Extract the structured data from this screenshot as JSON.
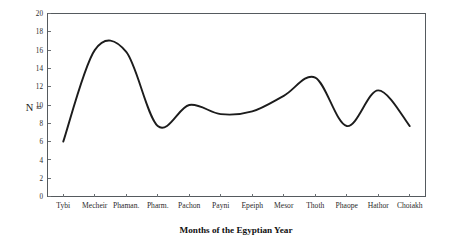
{
  "chart_data": {
    "type": "line",
    "title": "",
    "xlabel": "Months of the Egyptian Year",
    "ylabel": "N =",
    "categories": [
      "Tybi",
      "Mecheir",
      "Phaman.",
      "Pharm.",
      "Pachon",
      "Payni",
      "Epeiph",
      "Mesor",
      "Thoth",
      "Phaope",
      "Hathor",
      "Choiakh"
    ],
    "values": [
      6,
      16,
      15.8,
      7.7,
      10,
      9,
      9.3,
      11,
      13,
      7.7,
      11.6,
      7.7
    ],
    "series": [
      {
        "name": "N",
        "values": [
          6,
          16,
          15.8,
          7.7,
          10,
          9,
          9.3,
          11,
          13,
          7.7,
          11.6,
          7.7
        ]
      }
    ],
    "ylim": [
      0,
      20
    ],
    "y_ticks": [
      0,
      2,
      4,
      6,
      8,
      10,
      12,
      14,
      16,
      18,
      20
    ],
    "y_tick_labels": [
      "0",
      "2",
      "4",
      "6",
      "8",
      "10",
      "12",
      "14",
      "16",
      "18",
      "20"
    ],
    "grid": false,
    "legend": false,
    "legend_position": "none",
    "line_color": "#1c1c1c",
    "frame_color": "#555a5e",
    "background_color": "#ffffff",
    "smoothing": "spline"
  }
}
